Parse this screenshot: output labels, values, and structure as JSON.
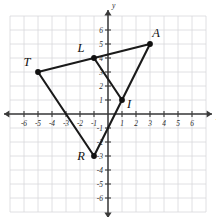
{
  "figure": {
    "title": "",
    "axis_labels": {
      "x": "x",
      "y": "y"
    }
  },
  "chart_data": {
    "type": "scatter",
    "title": "",
    "xlabel": "x",
    "ylabel": "y",
    "xlim": [
      -7,
      7
    ],
    "ylim": [
      -7,
      7
    ],
    "grid": true,
    "legend": "none",
    "x_ticks": [
      -6,
      -5,
      -4,
      -3,
      -2,
      -1,
      1,
      2,
      3,
      4,
      5,
      6
    ],
    "y_ticks": [
      -6,
      -5,
      -4,
      -3,
      -2,
      -1,
      1,
      2,
      3,
      4,
      5,
      6
    ],
    "x_tick_labels": [
      "-6",
      "-5",
      "-4",
      "-3",
      "-2",
      "-1",
      "1",
      "2",
      "3",
      "4",
      "5",
      "6"
    ],
    "y_tick_labels": [
      "-6",
      "-5",
      "-4",
      "-3",
      "-2",
      "-1",
      "1",
      "2",
      "3",
      "4",
      "5",
      "6"
    ],
    "points": [
      {
        "label": "T",
        "x": -5,
        "y": 3,
        "label_dx": -11,
        "label_dy": -6
      },
      {
        "label": "L",
        "x": -1,
        "y": 4,
        "label_dx": -13,
        "label_dy": -6
      },
      {
        "label": "A",
        "x": 3,
        "y": 5,
        "label_dx": 6,
        "label_dy": -7
      },
      {
        "label": "I",
        "x": 1,
        "y": 1,
        "label_dx": 7,
        "label_dy": 8
      },
      {
        "label": "R",
        "x": -1,
        "y": -3,
        "label_dx": -13,
        "label_dy": 4
      }
    ],
    "edges": [
      {
        "from": "T",
        "to": "L"
      },
      {
        "from": "L",
        "to": "A"
      },
      {
        "from": "L",
        "to": "I"
      },
      {
        "from": "I",
        "to": "A"
      },
      {
        "from": "T",
        "to": "R"
      },
      {
        "from": "R",
        "to": "I"
      }
    ],
    "values": [
      {
        "name": "T",
        "x": -5,
        "y": 3
      },
      {
        "name": "L",
        "x": -1,
        "y": 4
      },
      {
        "name": "A",
        "x": 3,
        "y": 5
      },
      {
        "name": "I",
        "x": 1,
        "y": 1
      },
      {
        "name": "R",
        "x": -1,
        "y": -3
      }
    ]
  },
  "geometry": {
    "origin_px": {
      "x": 108,
      "y": 114
    },
    "unit_px": 14.0,
    "grid_extent_units": 7
  }
}
